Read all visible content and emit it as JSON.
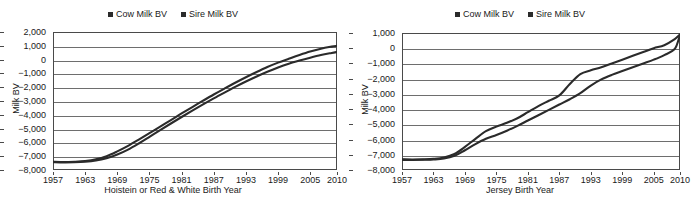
{
  "legend": {
    "entries": [
      {
        "label": "Cow Milk BV",
        "color": "#2b2b2b"
      },
      {
        "label": "Sire Milk BV",
        "color": "#2b2b2b"
      }
    ]
  },
  "charts": [
    {
      "panel": "left",
      "ylabel": "Milk BV",
      "xlabel": "Hoistein or Red & White Birth Year",
      "yticks": [
        "2,000",
        "1,000",
        "0",
        "−1,000",
        "−2,000",
        "−3,000",
        "−4,000",
        "−5,000",
        "−6,000",
        "−7,000",
        "−8,000"
      ],
      "xticks": [
        "1957",
        "1963",
        "1969",
        "1975",
        "1981",
        "1987",
        "1993",
        "1999",
        "2005",
        "2010"
      ]
    },
    {
      "panel": "right",
      "ylabel": "Milk BV",
      "xlabel": "Jersey Birth Year",
      "yticks": [
        "1,000",
        "0",
        "−1,000",
        "−2,000",
        "−3,000",
        "−4,000",
        "−5,000",
        "−6,000",
        "−7,000",
        "−8,000"
      ],
      "xticks": [
        "1957",
        "1963",
        "1969",
        "1975",
        "1981",
        "1987",
        "1993",
        "1999",
        "2005",
        "2010"
      ]
    }
  ],
  "chart_data": [
    {
      "type": "line",
      "title": "",
      "xlabel": "Hoistein or Red & White Birth Year",
      "ylabel": "Milk BV",
      "xlim": [
        1957,
        2010
      ],
      "ylim": [
        -8000,
        2000
      ],
      "ytick_step": 1000,
      "grid": true,
      "legend_position": "top-center",
      "x": [
        1957,
        1959,
        1961,
        1963,
        1965,
        1967,
        1969,
        1971,
        1973,
        1975,
        1977,
        1979,
        1981,
        1983,
        1985,
        1987,
        1989,
        1991,
        1993,
        1995,
        1997,
        1999,
        2001,
        2003,
        2005,
        2007,
        2009,
        2010
      ],
      "series": [
        {
          "name": "Cow Milk BV",
          "color": "#2b2b2b",
          "values": [
            -7400,
            -7420,
            -7400,
            -7350,
            -7230,
            -7000,
            -6650,
            -6250,
            -5800,
            -5330,
            -4850,
            -4380,
            -3900,
            -3440,
            -2980,
            -2530,
            -2100,
            -1680,
            -1280,
            -900,
            -540,
            -220,
            60,
            330,
            580,
            790,
            940,
            1000
          ]
        },
        {
          "name": "Sire Milk BV",
          "color": "#2b2b2b",
          "values": [
            -7430,
            -7450,
            -7440,
            -7400,
            -7310,
            -7140,
            -6880,
            -6520,
            -6080,
            -5600,
            -5110,
            -4630,
            -4160,
            -3700,
            -3250,
            -2810,
            -2390,
            -1980,
            -1590,
            -1220,
            -880,
            -570,
            -300,
            -70,
            140,
            330,
            480,
            550
          ]
        }
      ]
    },
    {
      "type": "line",
      "title": "",
      "xlabel": "Jersey Birth Year",
      "ylabel": "Milk BV",
      "xlim": [
        1957,
        2010
      ],
      "ylim": [
        -8000,
        1000
      ],
      "ytick_step": 1000,
      "grid": true,
      "legend_position": "top-center",
      "x": [
        1957,
        1959,
        1961,
        1963,
        1965,
        1967,
        1969,
        1971,
        1973,
        1975,
        1977,
        1979,
        1981,
        1983,
        1985,
        1987,
        1989,
        1991,
        1993,
        1995,
        1997,
        1999,
        2001,
        2003,
        2005,
        2007,
        2009,
        2010
      ],
      "series": [
        {
          "name": "Cow Milk BV",
          "color": "#2b2b2b",
          "values": [
            -7300,
            -7310,
            -7300,
            -7270,
            -7180,
            -6950,
            -6480,
            -5950,
            -5450,
            -5150,
            -4900,
            -4600,
            -4200,
            -3800,
            -3450,
            -3100,
            -2350,
            -1700,
            -1450,
            -1250,
            -1000,
            -750,
            -500,
            -250,
            0,
            200,
            600,
            900
          ]
        },
        {
          "name": "Sire Milk BV",
          "color": "#2b2b2b",
          "values": [
            -7330,
            -7340,
            -7330,
            -7310,
            -7250,
            -7070,
            -6700,
            -6300,
            -5950,
            -5700,
            -5420,
            -5100,
            -4750,
            -4400,
            -4050,
            -3700,
            -3350,
            -2950,
            -2450,
            -2050,
            -1750,
            -1500,
            -1250,
            -1000,
            -750,
            -450,
            -50,
            880
          ]
        }
      ]
    }
  ]
}
